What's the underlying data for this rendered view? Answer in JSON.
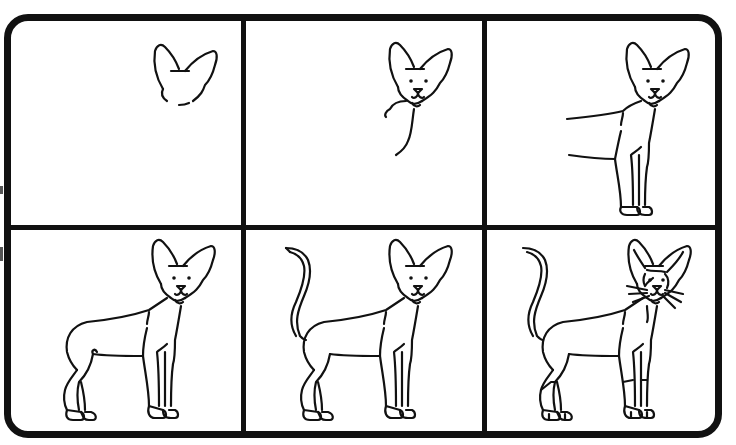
{
  "colors": {
    "ink": "#111111",
    "paper": "#ffffff"
  },
  "grid": {
    "rows": 2,
    "cols": 3
  },
  "panels": [
    {
      "step": "Step 1",
      "description": "Ears and top of head outline"
    },
    {
      "step": "Step 2",
      "description": "Face with eyes and nose, neck line begun"
    },
    {
      "step": "Step 3",
      "description": "Chest, front legs and start of body lines"
    },
    {
      "step": "Step 4",
      "description": "Full body with hind legs"
    },
    {
      "step": "Step 5",
      "description": "Tail added"
    },
    {
      "step": "Step 6",
      "description": "Details: whiskers, face markings, leg lines"
    }
  ]
}
